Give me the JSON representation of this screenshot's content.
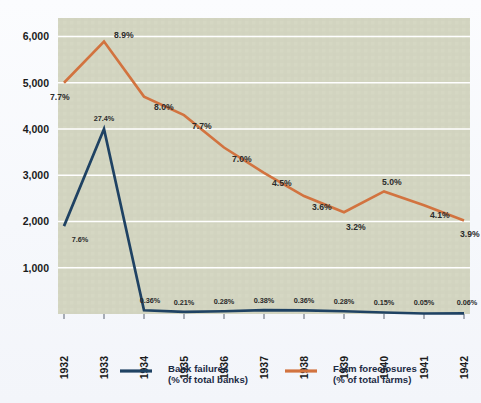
{
  "chart_data": {
    "type": "line",
    "title": "",
    "subtitle": "",
    "xlabel": "",
    "ylabel": "",
    "categories": [
      "1932",
      "1933",
      "1934",
      "1935",
      "1936",
      "1937",
      "1938",
      "1939",
      "1940",
      "1941",
      "1942"
    ],
    "ylim": [
      0,
      6400
    ],
    "yticks": [
      "1,000",
      "2,000",
      "3,000",
      "4,000",
      "5,000",
      "6,000"
    ],
    "ytick_values": [
      1000,
      2000,
      3000,
      4000,
      5000,
      6000
    ],
    "grid": true,
    "legend_position": "bottom",
    "series": [
      {
        "name": "Bank failures",
        "sublabel": "(% of total banks)",
        "color": "#1f4263",
        "values": [
          1900,
          4000,
          80,
          45,
          60,
          82,
          78,
          60,
          32,
          11,
          13
        ],
        "point_labels": [
          "7.6%",
          "27.4%",
          "0.36%",
          "0.21%",
          "0.28%",
          "0.38%",
          "0.36%",
          "0.28%",
          "0.15%",
          "0.05%",
          "0.06%"
        ]
      },
      {
        "name": "Farm foreclosures",
        "sublabel": "(% of total farms)",
        "color": "#d2733f",
        "values": [
          5000,
          5890,
          4700,
          4300,
          3600,
          3050,
          2550,
          2200,
          2650,
          2350,
          2020
        ],
        "point_labels": [
          "7.7%",
          "8.9%",
          "8.0%",
          "7.7%",
          "7.0%",
          "4.5%",
          "3.6%",
          "3.2%",
          "5.0%",
          "4.1%",
          "3.9%"
        ]
      }
    ]
  },
  "legend": {
    "items": [
      {
        "name": "Bank failures",
        "sublabel": "(% of total banks)",
        "color": "#1f4263"
      },
      {
        "name": "Farm foreclosures",
        "sublabel": "(% of total farms)",
        "color": "#d2733f"
      }
    ]
  },
  "colors": {
    "plot_background": "#d4d6c3",
    "page_background": "#f6f8fc",
    "gridline": "#ffffff",
    "bank_failures": "#1f4263",
    "farm_foreclosures": "#d2733f",
    "axis_text": "#1b1b1b"
  }
}
